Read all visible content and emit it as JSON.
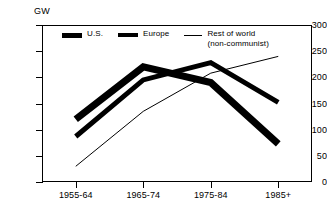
{
  "chart_data": {
    "type": "line",
    "title": "",
    "xlabel": "",
    "ylabel": "GW",
    "unit_label": "GW",
    "categories": [
      "1955-64",
      "1965-74",
      "1975-84",
      "1985+"
    ],
    "ylim": [
      0,
      300
    ],
    "yticks": [
      0,
      50,
      100,
      150,
      200,
      250,
      300
    ],
    "ytick_labels": [
      "0",
      "50",
      "100",
      "150",
      "200",
      "250",
      "300"
    ],
    "grid": false,
    "legend_position": "top-inside",
    "series": [
      {
        "name": "U.S.",
        "values": [
          120,
          220,
          190,
          73
        ],
        "style": "very-thick-solid",
        "color": "#000000",
        "line_width": 7
      },
      {
        "name": "Europe",
        "values": [
          87,
          195,
          228,
          152
        ],
        "style": "thick-solid",
        "color": "#000000",
        "line_width": 5
      },
      {
        "name": "Rest of world\n(non-communist)",
        "values": [
          30,
          135,
          208,
          240
        ],
        "style": "thin-solid",
        "color": "#000000",
        "line_width": 1
      }
    ]
  },
  "legend": {
    "items": [
      {
        "label": "U.S.",
        "swatch": "thick-bar"
      },
      {
        "label": "Europe",
        "swatch": "thick-bar"
      },
      {
        "label": "Rest of world\n(non-communist)",
        "swatch": "thin-line"
      }
    ]
  },
  "axis": {
    "unit": "GW"
  }
}
